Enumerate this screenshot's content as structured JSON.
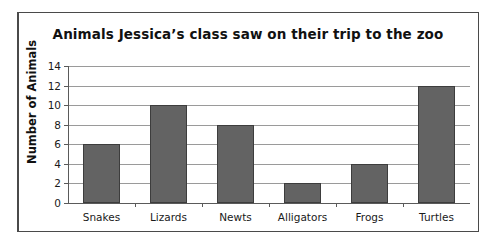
{
  "chart_data": {
    "type": "bar",
    "title": "Animals Jessica’s class saw on their trip to the zoo",
    "xlabel": "",
    "ylabel": "Number of Animals",
    "categories": [
      "Snakes",
      "Lizards",
      "Newts",
      "Alligators",
      "Frogs",
      "Turtles"
    ],
    "values": [
      6,
      10,
      8,
      2,
      4,
      12
    ],
    "ylim": [
      0,
      14
    ],
    "ytick_labels": [
      "0",
      "2",
      "4",
      "6",
      "8",
      "10",
      "12",
      "14"
    ],
    "ytick_values": [
      0,
      2,
      4,
      6,
      8,
      10,
      12,
      14
    ],
    "grid": "horizontal",
    "legend": "none",
    "colors": {
      "bar_fill": "#636363",
      "bar_edge": "#3d3d3d",
      "gridline": "#9a9a9a",
      "axis": "#5a5a5a",
      "text": "#111111",
      "background": "#ffffff",
      "frame": "#4a4a4a"
    }
  }
}
